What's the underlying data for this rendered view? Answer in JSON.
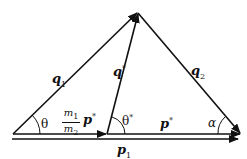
{
  "diagram": {
    "type": "vector triangle (momentum kinematics)",
    "vectors": {
      "q1": {
        "label": "q",
        "sub": "1"
      },
      "q_star": {
        "label": "q",
        "sup": "*"
      },
      "q2": {
        "label": "q",
        "sub": "2"
      },
      "p_star_scaled": {
        "num": "m1",
        "den": "m2",
        "label": "p",
        "sup": "*"
      },
      "p_star": {
        "label": "p",
        "sup": "*"
      },
      "p1": {
        "label": "p",
        "sub": "1"
      }
    },
    "angles": {
      "theta": "θ",
      "theta_star": "θ",
      "theta_star_sup": "*",
      "alpha": "α"
    },
    "frac": {
      "num_m": "m",
      "num_sub": "1",
      "den_m": "m",
      "den_sub": "2"
    }
  }
}
